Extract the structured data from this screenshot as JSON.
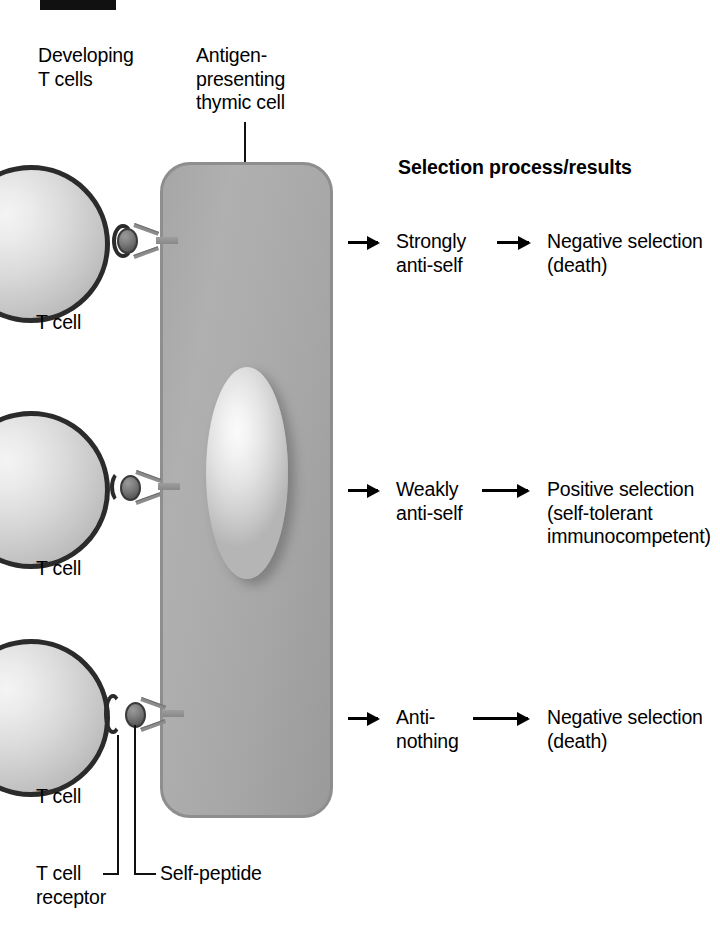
{
  "diagram": {
    "title_header": "Selection process/results",
    "column_labels": {
      "developing_t_cells": "Developing\nT cells",
      "antigen_presenting": "Antigen-\npresenting\nthymic cell"
    },
    "cell_label": "T cell",
    "callouts": {
      "t_cell_receptor": "T cell\nreceptor",
      "self_peptide": "Self-peptide"
    },
    "rows": [
      {
        "id": "strongly-anti-self",
        "affinity": "Strongly\nanti-self",
        "outcome": "Negative selection\n(death)",
        "cell_label": "T cell"
      },
      {
        "id": "weakly-anti-self",
        "affinity": "Weakly\nanti-self",
        "outcome": "Positive selection\n(self-tolerant\nimmunocompetent)",
        "cell_label": "T cell"
      },
      {
        "id": "anti-nothing",
        "affinity": "Anti-\nnothing",
        "outcome": "Negative selection\n(death)",
        "cell_label": "T cell"
      }
    ],
    "colors": {
      "thymic_cell_fill": "#a9a9a9",
      "thymic_cell_border": "#8e8e8e",
      "nucleus_fill": "#eaeaea",
      "t_cell_border": "#2b2b2b",
      "t_cell_fill": "#d2d2d2",
      "receptor_bead": "#5c5c5c",
      "text": "#000000",
      "background": "#ffffff"
    }
  }
}
